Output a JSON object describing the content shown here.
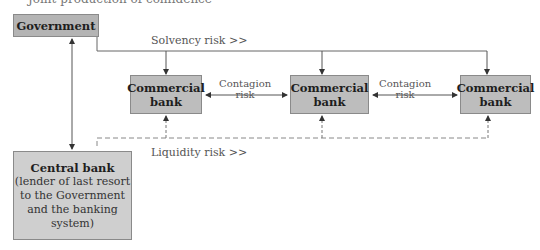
{
  "clipped_caption": "Joint production of confidence",
  "nodes": {
    "government": "Government",
    "commercial_banks": [
      {
        "line1": "Commercial",
        "line2": "bank"
      },
      {
        "line1": "Commercial",
        "line2": "bank"
      },
      {
        "line1": "Commercial",
        "line2": "bank"
      }
    ],
    "central_bank": {
      "title": "Central bank",
      "description": [
        "(lender of last resort",
        "to the Government",
        "and the banking",
        "system)"
      ]
    }
  },
  "labels": {
    "solvency": "Solvency risk >>",
    "liquidity": "Liquidity risk >>",
    "contagion": [
      {
        "line1": "Contagion",
        "line2": "risk"
      },
      {
        "line1": "Contagion",
        "line2": "risk"
      }
    ]
  },
  "colors": {
    "box_fill": "#bdbdbd",
    "central_fill": "#cfcfcf",
    "line": "#555555"
  }
}
